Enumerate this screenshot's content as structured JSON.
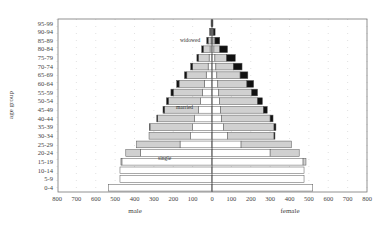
{
  "chart_data": {
    "type": "bar",
    "subtype": "population-pyramid-stacked",
    "title": "",
    "xlabel_left": "male",
    "xlabel_right": "female",
    "ylabel": "age group",
    "x_ticks_left": [
      "800",
      "700",
      "600",
      "500",
      "400",
      "300",
      "200",
      "100",
      "0"
    ],
    "x_ticks_right": [
      "100",
      "200",
      "300",
      "400",
      "500",
      "600",
      "700",
      "800"
    ],
    "xlim": [
      -800,
      800
    ],
    "grid": "dotted vertical",
    "categories": [
      "0-4",
      "5-9",
      "10-14",
      "15-19",
      "20-24",
      "25-29",
      "30-34",
      "35-39",
      "40-44",
      "45-49",
      "50-54",
      "55-59",
      "60-64",
      "65-69",
      "70-74",
      "75-79",
      "80-84",
      "85-89",
      "90-94",
      "95-99"
    ],
    "series": [
      {
        "name": "male single",
        "values": [
          535,
          475,
          475,
          465,
          370,
          165,
          110,
          100,
          90,
          70,
          60,
          50,
          40,
          30,
          20,
          15,
          10,
          5,
          3,
          1
        ]
      },
      {
        "name": "male married",
        "values": [
          0,
          0,
          0,
          5,
          75,
          225,
          215,
          220,
          190,
          175,
          165,
          150,
          130,
          100,
          80,
          55,
          35,
          15,
          5,
          2
        ]
      },
      {
        "name": "male widowed",
        "values": [
          0,
          0,
          0,
          0,
          0,
          0,
          0,
          2,
          5,
          8,
          10,
          12,
          12,
          12,
          10,
          8,
          8,
          7,
          4,
          2
        ]
      },
      {
        "name": "female single",
        "values": [
          520,
          475,
          475,
          470,
          300,
          150,
          80,
          60,
          50,
          45,
          40,
          35,
          30,
          25,
          20,
          15,
          10,
          5,
          3,
          1
        ]
      },
      {
        "name": "female married",
        "values": [
          0,
          0,
          0,
          15,
          150,
          260,
          240,
          260,
          250,
          220,
          195,
          170,
          150,
          120,
          90,
          60,
          30,
          10,
          3,
          1
        ]
      },
      {
        "name": "female widowed",
        "values": [
          0,
          0,
          0,
          0,
          0,
          0,
          5,
          10,
          15,
          20,
          25,
          30,
          35,
          40,
          45,
          45,
          40,
          25,
          10,
          3
        ]
      }
    ],
    "annotations": [
      "single",
      "married",
      "widowed"
    ],
    "colors": {
      "single": "#ffffff",
      "married": "#d0d0d0",
      "widowed": "#111111",
      "outline": "#555555"
    }
  },
  "labels": {
    "ylabel": "age group",
    "male": "male",
    "female": "female",
    "single": "single",
    "married": "married",
    "widowed": "widowed"
  }
}
